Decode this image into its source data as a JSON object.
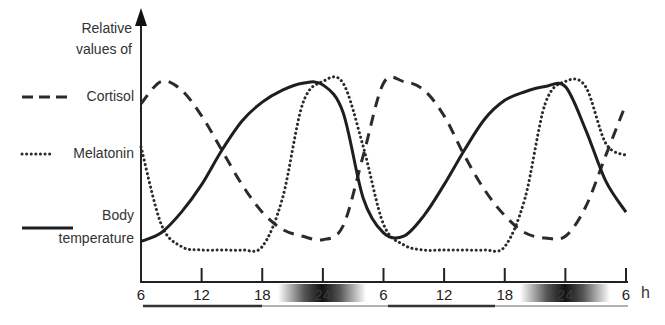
{
  "chart_data": {
    "type": "line",
    "title": "",
    "ylabel": "Relative values of",
    "xlabel": "h",
    "x_unit": "h",
    "x_ticks": [
      "6",
      "12",
      "18",
      "24",
      "6",
      "12",
      "18",
      "24",
      "6"
    ],
    "x_hours": [
      6,
      12,
      18,
      24,
      30,
      36,
      42,
      48,
      54
    ],
    "ylim": [
      0,
      1
    ],
    "grid": false,
    "legend_position": "left",
    "night_periods": [
      {
        "start_h": 20,
        "end_h": 28,
        "peak_h": 24
      },
      {
        "start_h": 44,
        "end_h": 52,
        "peak_h": 48
      }
    ],
    "x": [
      6,
      8,
      10,
      12,
      14,
      16,
      18,
      20,
      22,
      24,
      26,
      28,
      30,
      32,
      34,
      36,
      38,
      40,
      42,
      44,
      46,
      48,
      50,
      52,
      54
    ],
    "series": [
      {
        "name": "Cortisol",
        "style": "dashed",
        "values": [
          0.85,
          0.98,
          0.93,
          0.78,
          0.58,
          0.38,
          0.22,
          0.12,
          0.08,
          0.06,
          0.14,
          0.55,
          0.97,
          0.98,
          0.93,
          0.78,
          0.55,
          0.35,
          0.2,
          0.1,
          0.07,
          0.08,
          0.25,
          0.55,
          0.85
        ]
      },
      {
        "name": "Melatonin",
        "style": "dotted",
        "values": [
          0.6,
          0.15,
          0.02,
          0.0,
          0.0,
          0.0,
          0.02,
          0.3,
          0.85,
          0.98,
          0.97,
          0.6,
          0.15,
          0.03,
          0.0,
          0.0,
          0.0,
          0.0,
          0.02,
          0.3,
          0.85,
          0.98,
          0.95,
          0.62,
          0.55
        ]
      },
      {
        "name": "Body temperature",
        "style": "solid",
        "values": [
          0.05,
          0.1,
          0.22,
          0.38,
          0.58,
          0.75,
          0.86,
          0.93,
          0.97,
          0.96,
          0.8,
          0.3,
          0.1,
          0.08,
          0.2,
          0.38,
          0.58,
          0.76,
          0.87,
          0.92,
          0.95,
          0.95,
          0.7,
          0.4,
          0.22
        ]
      }
    ]
  },
  "axis": {
    "ylabel_line1": "Relative",
    "ylabel_line2": "values of",
    "x_unit": "h",
    "ticks": [
      "6",
      "12",
      "18",
      "24",
      "6",
      "12",
      "18",
      "24",
      "6"
    ]
  },
  "legend": {
    "cortisol": "Cortisol",
    "melatonin": "Melatonin",
    "body_line1": "Body",
    "body_line2": "temperature"
  }
}
